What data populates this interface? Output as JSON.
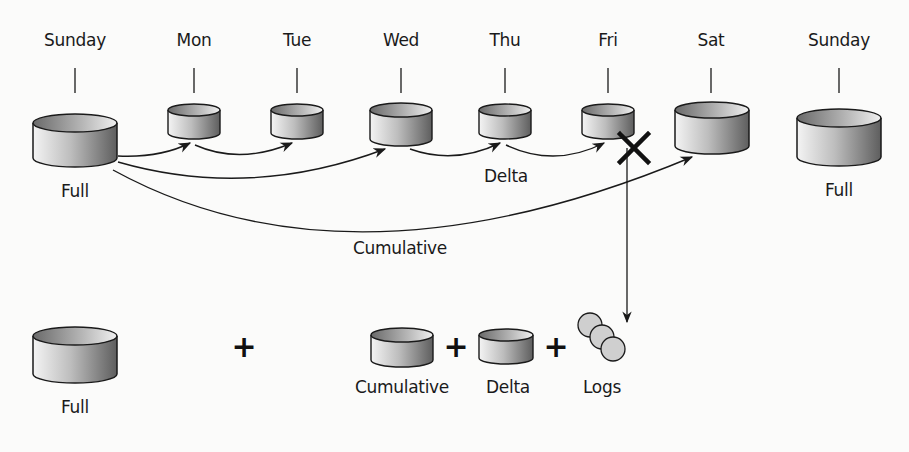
{
  "days": [
    {
      "label": "Sunday",
      "x": 75
    },
    {
      "label": "Mon",
      "x": 194
    },
    {
      "label": "Tue",
      "x": 297
    },
    {
      "label": "Wed",
      "x": 401
    },
    {
      "label": "Thu",
      "x": 505
    },
    {
      "label": "Fri",
      "x": 608
    },
    {
      "label": "Sat",
      "x": 711
    },
    {
      "label": "Sunday",
      "x": 839
    }
  ],
  "timeline_labels": {
    "full_left": "Full",
    "full_right": "Full",
    "delta": "Delta",
    "cumulative": "Cumulative"
  },
  "restore": {
    "full": "Full",
    "cumulative": "Cumulative",
    "delta": "Delta",
    "logs": "Logs",
    "plus": "+"
  },
  "colors": {
    "stroke": "#1a1a1a",
    "disk_light": "#f2f2f2",
    "disk_dark": "#6e6e6e",
    "log_fill": "#cfcfcf",
    "background": "#fbfbfa"
  }
}
